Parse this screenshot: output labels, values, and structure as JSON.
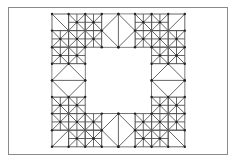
{
  "diagram": {
    "type": "triangulated-mesh",
    "frame": {
      "x": 8,
      "y": 7,
      "w": 220,
      "h": 148
    },
    "grid": {
      "x0": 52,
      "y0": 14,
      "cell": 16.6,
      "cols": 8,
      "rows": 8
    },
    "hole": {
      "col0": 2,
      "row0": 2,
      "col1": 6,
      "row1": 6
    },
    "line_color": "#555555",
    "node_color": "#222222",
    "frame_color": "#8a8a8a",
    "corner_cells": [
      [
        0,
        0,
        "tlbr"
      ],
      [
        7,
        0,
        "trbl"
      ],
      [
        0,
        7,
        "trbl"
      ],
      [
        7,
        7,
        "tlbr"
      ]
    ],
    "refined_cells": [
      [
        1,
        0
      ],
      [
        2,
        0
      ],
      [
        0,
        1
      ],
      [
        1,
        1
      ],
      [
        2,
        1
      ],
      [
        0,
        2
      ],
      [
        1,
        2
      ],
      [
        5,
        0
      ],
      [
        6,
        0
      ],
      [
        5,
        1
      ],
      [
        6,
        1
      ],
      [
        7,
        1
      ],
      [
        6,
        2
      ],
      [
        7,
        2
      ],
      [
        0,
        5
      ],
      [
        1,
        5
      ],
      [
        0,
        6
      ],
      [
        1,
        6
      ],
      [
        2,
        6
      ],
      [
        1,
        7
      ],
      [
        2,
        7
      ],
      [
        6,
        5
      ],
      [
        7,
        5
      ],
      [
        5,
        6
      ],
      [
        6,
        6
      ],
      [
        7,
        6
      ],
      [
        5,
        7
      ],
      [
        6,
        7
      ]
    ],
    "diamond_blocks": [
      {
        "col": 3,
        "row": 0,
        "w": 2,
        "h": 2,
        "split": "vertical"
      },
      {
        "col": 3,
        "row": 6,
        "w": 2,
        "h": 2,
        "split": "vertical"
      },
      {
        "col": 0,
        "row": 3,
        "w": 2,
        "h": 2,
        "split": "horizontal"
      },
      {
        "col": 6,
        "row": 3,
        "w": 2,
        "h": 2,
        "split": "horizontal"
      }
    ]
  }
}
